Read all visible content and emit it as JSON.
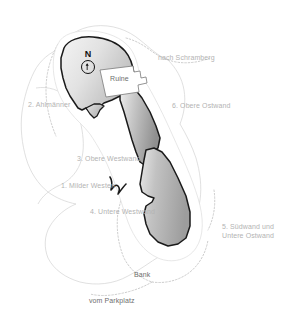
{
  "map": {
    "title": "Kletterfels Topo",
    "compass": {
      "north_label": "N",
      "icon": "compass-north-arrow-icon"
    },
    "ruin": {
      "label": "Ruine"
    },
    "colors": {
      "rock_fill_light": "#efefef",
      "rock_fill_mid": "#c9c9c9",
      "rock_fill_dark": "#9a9a9a",
      "rock_outline": "#1a1a1a",
      "terrain_line": "#cfcfcf",
      "path_dotted": "#c4c4c4",
      "label_text": "#b3b3b3",
      "label_text_dark": "#6e6e6e",
      "background": "#ffffff"
    },
    "sectors": [
      {
        "id": 1,
        "label": "1. Milder Westen",
        "x": 61,
        "y": 181
      },
      {
        "id": 2,
        "label": "2. Ahlmänner",
        "x": 28,
        "y": 100
      },
      {
        "id": 3,
        "label": "3. Obere Westwand",
        "x": 77,
        "y": 154
      },
      {
        "id": 4,
        "label": "4. Untere Westwand",
        "x": 90,
        "y": 207
      },
      {
        "id": 6,
        "label": "6. Obere Ostwand",
        "x": 172,
        "y": 101
      }
    ],
    "sector_multiline": [
      {
        "id": 5,
        "line1": "5. Südwand und",
        "line2": "Untere Ostwand",
        "x": 222,
        "y": 222
      }
    ],
    "place_labels": [
      {
        "name": "nach-schramberg",
        "label": "nach Schramberg",
        "x": 158,
        "y": 53
      },
      {
        "name": "bank",
        "label": "Bank",
        "x": 134,
        "y": 270
      },
      {
        "name": "vom-parkplatz",
        "label": "vom Parkplatz",
        "x": 89,
        "y": 296
      }
    ]
  }
}
